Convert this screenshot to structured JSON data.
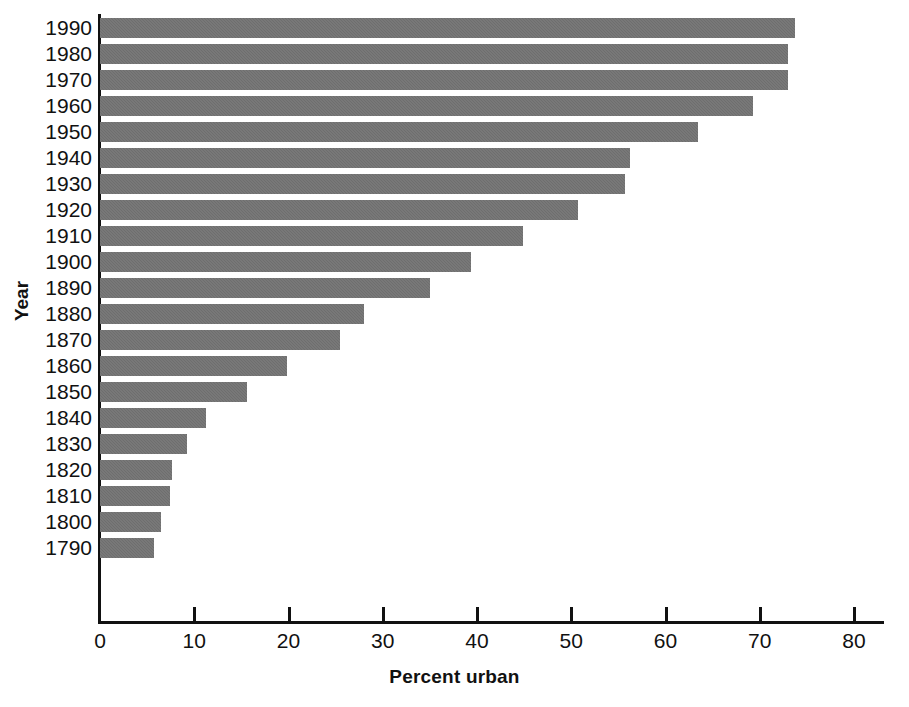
{
  "chart_data": {
    "type": "bar",
    "orientation": "horizontal",
    "title": "",
    "xlabel": "Percent urban",
    "ylabel": "Year",
    "categories": [
      "1990",
      "1980",
      "1970",
      "1960",
      "1950",
      "1940",
      "1930",
      "1920",
      "1910",
      "1900",
      "1890",
      "1880",
      "1870",
      "1860",
      "1850",
      "1840",
      "1830",
      "1820",
      "1810",
      "1800",
      "1790"
    ],
    "values": [
      73.7,
      73.0,
      73.0,
      69.3,
      63.5,
      56.2,
      55.7,
      50.7,
      44.9,
      39.4,
      35.0,
      28.0,
      25.5,
      19.8,
      15.6,
      11.2,
      9.2,
      7.6,
      7.4,
      6.5,
      5.7
    ],
    "xlim": [
      0,
      80
    ],
    "xticks": [
      0,
      10,
      20,
      30,
      40,
      50,
      60,
      70,
      80
    ],
    "xtick_labels": [
      "0",
      "10",
      "20",
      "30",
      "40",
      "50",
      "60",
      "70",
      "80"
    ],
    "grid": false,
    "legend": false,
    "bar_color": "#6e6e6e",
    "axis_color": "#111111",
    "background": "#ffffff"
  }
}
